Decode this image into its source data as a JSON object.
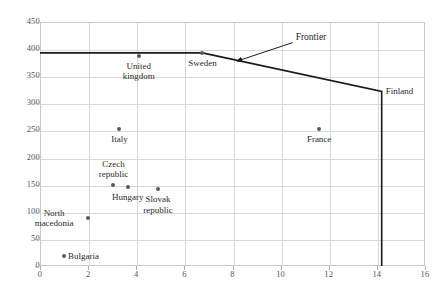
{
  "chart_data": {
    "type": "scatter",
    "title": "",
    "xlabel": "",
    "ylabel": "",
    "xlim": [
      0,
      16
    ],
    "ylim": [
      0,
      450
    ],
    "xticks": [
      0,
      2,
      4,
      6,
      8,
      10,
      12,
      14,
      16
    ],
    "yticks": [
      0,
      50,
      100,
      150,
      200,
      250,
      300,
      350,
      400,
      450
    ],
    "grid": true,
    "legend": "none",
    "points": [
      {
        "label": "Bulgaria",
        "x": 1.0,
        "y": 18,
        "label_pos": "right"
      },
      {
        "label": "North\nmacedonia",
        "x": 2.0,
        "y": 88,
        "label_pos": "left"
      },
      {
        "label": "Czech\nrepublic",
        "x": 3.05,
        "y": 150,
        "label_pos": "above"
      },
      {
        "label": "Hungary",
        "x": 3.65,
        "y": 145,
        "label_pos": "below"
      },
      {
        "label": "Slovak\nrepublic",
        "x": 4.9,
        "y": 142,
        "label_pos": "below"
      },
      {
        "label": "Italy",
        "x": 3.3,
        "y": 252,
        "label_pos": "below"
      },
      {
        "label": "United\nkingdom",
        "x": 4.1,
        "y": 388,
        "label_pos": "below"
      },
      {
        "label": "Sweden",
        "x": 6.75,
        "y": 393,
        "label_pos": "below"
      },
      {
        "label": "France",
        "x": 11.6,
        "y": 253,
        "label_pos": "below"
      },
      {
        "label": "Finland",
        "x": 14.2,
        "y": 322,
        "label_pos": "right"
      }
    ],
    "frontier": {
      "name": "Frontier",
      "vertices": [
        {
          "x": 0.0,
          "y": 393
        },
        {
          "x": 6.75,
          "y": 393
        },
        {
          "x": 14.2,
          "y": 322
        },
        {
          "x": 14.2,
          "y": 0
        }
      ]
    },
    "annotation": {
      "text": "Frontier",
      "arrow_from": {
        "x": 10.5,
        "y": 412
      },
      "arrow_to": {
        "x": 8.2,
        "y": 378
      }
    },
    "series_color": "#5a5a5a",
    "frontier_color": "#1a1a1a",
    "grid_color": "#d8d8d8"
  },
  "ticks": {
    "y": [
      "0",
      "50",
      "100",
      "150",
      "200",
      "250",
      "300",
      "350",
      "400",
      "450"
    ],
    "x": [
      "0",
      "2",
      "4",
      "6",
      "8",
      "10",
      "12",
      "14",
      "16"
    ]
  },
  "labels": {
    "bulgaria": "Bulgaria",
    "north_macedonia": "North\nmacedonia",
    "czech_republic": "Czech\nrepublic",
    "hungary": "Hungary",
    "slovak_republic": "Slovak\nrepublic",
    "italy": "Italy",
    "united_kingdom": "United\nkingdom",
    "sweden": "Sweden",
    "france": "France",
    "finland": "Finland",
    "frontier": "Frontier"
  }
}
